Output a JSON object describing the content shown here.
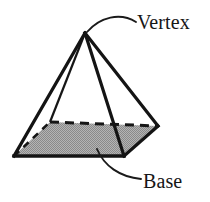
{
  "figure": {
    "kind": "geometry-diagram",
    "canvas": {
      "width": 210,
      "height": 202
    },
    "colors": {
      "background": "#ffffff",
      "stroke": "#141414",
      "base_fill": "#9b9b9b",
      "base_fill_light": "#b8b8b8",
      "label_text": "#161616",
      "leader_line": "#1a1a1a"
    },
    "geometry": {
      "apex": {
        "x": 85,
        "y": 33
      },
      "base_corners": {
        "left": {
          "x": 14,
          "y": 156
        },
        "front": {
          "x": 124,
          "y": 156
        },
        "right": {
          "x": 158,
          "y": 126
        },
        "back": {
          "x": 50,
          "y": 122
        }
      },
      "visible_edges": [
        "apex-left",
        "apex-front",
        "apex-right",
        "left-front",
        "front-right"
      ],
      "hidden_edges": [
        "apex-back",
        "back-left",
        "back-right"
      ]
    },
    "labels": [
      {
        "id": "vertex",
        "text": "Vertex",
        "x": 138,
        "y": 29,
        "anchor_point": {
          "x": 88,
          "y": 33
        },
        "leader_path": "M 136 22 C 120 12, 100 18, 88 32"
      },
      {
        "id": "base",
        "text": "Base",
        "x": 144,
        "y": 190,
        "anchor_point": {
          "x": 97,
          "y": 148
        },
        "leader_path": "M 97 148 C 106 166, 122 178, 142 180"
      }
    ]
  }
}
